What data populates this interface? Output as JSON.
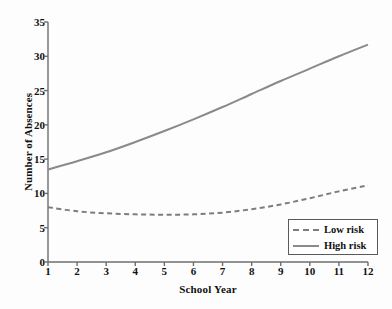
{
  "chart_data": {
    "type": "line",
    "title": "",
    "xlabel": "School Year",
    "ylabel": "Number of Absences",
    "xlim": [
      1,
      12
    ],
    "ylim": [
      0,
      35
    ],
    "grid": false,
    "legend_position": "bottom-right",
    "x": [
      1,
      2,
      3,
      4,
      5,
      6,
      7,
      8,
      9,
      10,
      11,
      12
    ],
    "xticks": [
      "1",
      "2",
      "3",
      "4",
      "5",
      "6",
      "7",
      "8",
      "9",
      "10",
      "11",
      "12"
    ],
    "yticks": [
      "0",
      "5",
      "10",
      "15",
      "20",
      "25",
      "30",
      "35"
    ],
    "ytick_values": [
      0,
      5,
      10,
      15,
      20,
      25,
      30,
      35
    ],
    "series": [
      {
        "name": "Low risk",
        "style": "dashed",
        "color": "#7d7d7d",
        "values": [
          8.0,
          7.4,
          7.1,
          6.95,
          6.9,
          6.95,
          7.2,
          7.7,
          8.4,
          9.3,
          10.3,
          11.2
        ]
      },
      {
        "name": "High risk",
        "style": "solid",
        "color": "#8a8a8a",
        "values": [
          13.5,
          14.7,
          16.0,
          17.5,
          19.1,
          20.8,
          22.6,
          24.5,
          26.4,
          28.2,
          30.0,
          31.7
        ]
      }
    ]
  },
  "legend": {
    "entries": [
      {
        "label": "Low risk"
      },
      {
        "label": "High risk"
      }
    ]
  },
  "axis_colors": {
    "axis_line": "#6e6e6e",
    "text": "#111111"
  }
}
